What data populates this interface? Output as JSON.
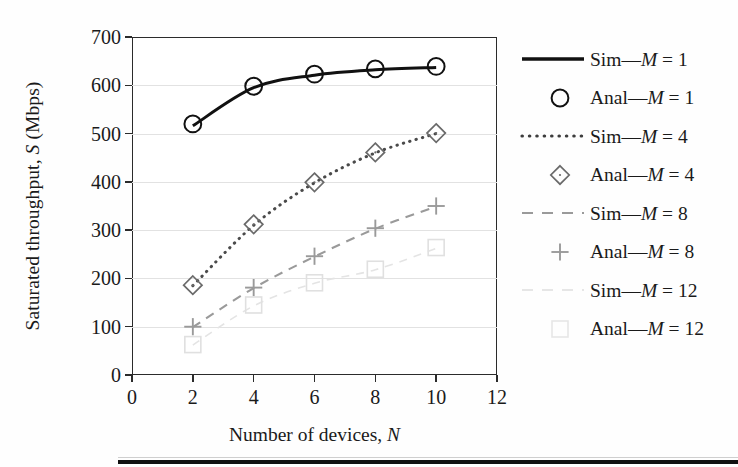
{
  "chart_data": {
    "type": "line",
    "title": "",
    "xlabel": "Number of devices, N",
    "ylabel": "Saturated throughput, S (Mbps)",
    "xlim": [
      0,
      12
    ],
    "ylim": [
      0,
      700
    ],
    "xticks": [
      0,
      2,
      4,
      6,
      8,
      10,
      12
    ],
    "yticks": [
      0,
      100,
      200,
      300,
      400,
      500,
      600,
      700
    ],
    "grid": "horizontal",
    "legend_position": "right",
    "x": [
      2,
      4,
      6,
      8,
      10
    ],
    "series": [
      {
        "name": "Sim—M = 1",
        "style": "solid",
        "color": "#111111",
        "marker": "none",
        "values": [
          516,
          595,
          621,
          632,
          637
        ]
      },
      {
        "name": "Anal—M = 1",
        "style": "none",
        "color": "#111111",
        "marker": "circle",
        "values": [
          520,
          598,
          623,
          634,
          639
        ]
      },
      {
        "name": "Sim—M = 4",
        "style": "dotted",
        "color": "#4a4a4a",
        "marker": "none",
        "values": [
          185,
          310,
          398,
          460,
          500
        ]
      },
      {
        "name": "Anal—M = 4",
        "style": "none",
        "color": "#6a6a6a",
        "marker": "diamond",
        "values": [
          186,
          312,
          399,
          461,
          501
        ]
      },
      {
        "name": "Sim—M = 8",
        "style": "dashed",
        "color": "#9a9a9a",
        "marker": "none",
        "values": [
          99,
          180,
          245,
          303,
          349
        ]
      },
      {
        "name": "Anal—M = 8",
        "style": "none",
        "color": "#9a9a9a",
        "marker": "plus",
        "values": [
          100,
          181,
          246,
          304,
          350
        ]
      },
      {
        "name": "Sim—M = 12",
        "style": "faint-dashed",
        "color": "#e4e4e4",
        "marker": "none",
        "values": [
          62,
          143,
          190,
          218,
          262
        ]
      },
      {
        "name": "Anal—M = 12",
        "style": "none",
        "color": "#e0e0e0",
        "marker": "square",
        "values": [
          63,
          145,
          191,
          219,
          264
        ]
      }
    ]
  },
  "legend": {
    "items": [
      {
        "label_prefix": "Sim—",
        "label_var": "M",
        "label_suffix": " = 1",
        "sample": "solid-line"
      },
      {
        "label_prefix": "Anal—",
        "label_var": "M",
        "label_suffix": " = 1",
        "sample": "circle-marker"
      },
      {
        "label_prefix": "Sim—",
        "label_var": "M",
        "label_suffix": " = 4",
        "sample": "dotted-line"
      },
      {
        "label_prefix": "Anal—",
        "label_var": "M",
        "label_suffix": " = 4",
        "sample": "diamond-marker"
      },
      {
        "label_prefix": "Sim—",
        "label_var": "M",
        "label_suffix": " = 8",
        "sample": "dashed-line"
      },
      {
        "label_prefix": "Anal—",
        "label_var": "M",
        "label_suffix": " = 8",
        "sample": "plus-marker"
      },
      {
        "label_prefix": "Sim—",
        "label_var": "M",
        "label_suffix": " = 12",
        "sample": "faint-dashed-line"
      },
      {
        "label_prefix": "Anal—",
        "label_var": "M",
        "label_suffix": " = 12",
        "sample": "faint-square-marker"
      }
    ]
  },
  "axes": {
    "y_title_text": "Saturated throughput, ",
    "y_title_var": "S",
    "y_title_tail": " (Mbps)",
    "x_title_text": "Number of devices, ",
    "x_title_var": "N"
  }
}
